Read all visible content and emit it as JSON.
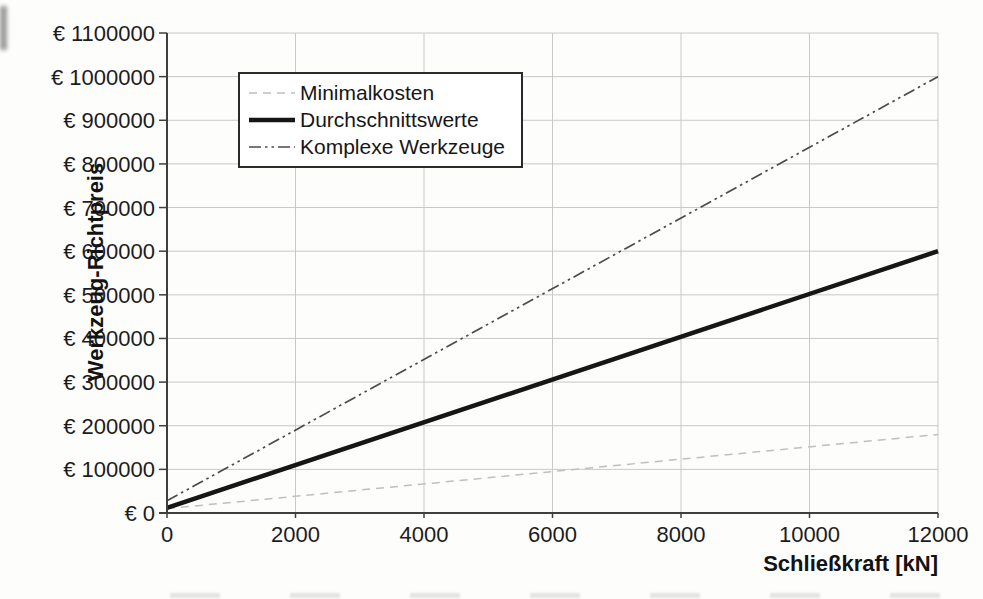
{
  "page": {
    "background": "#fcfcfc"
  },
  "chart_data": {
    "type": "line",
    "title": "",
    "xlabel": "Schließkraft [kN]",
    "ylabel": "Werkzeug-Richtpreis",
    "xlim": [
      0,
      12000
    ],
    "ylim": [
      0,
      1100000
    ],
    "x_ticks": [
      0,
      2000,
      4000,
      6000,
      8000,
      10000,
      12000
    ],
    "y_ticks": [
      0,
      100000,
      200000,
      300000,
      400000,
      500000,
      600000,
      700000,
      800000,
      900000,
      1000000,
      1100000
    ],
    "y_tick_prefix": "€ ",
    "grid": "on",
    "legend_position": "upper-left",
    "series": [
      {
        "name": "Minimalkosten",
        "x": [
          0,
          12000
        ],
        "y": [
          10000,
          180000
        ],
        "line_style": "dashed",
        "color": "#bfbfbf",
        "line_width": 1.5
      },
      {
        "name": "Durchschnittswerte",
        "x": [
          0,
          12000
        ],
        "y": [
          12000,
          600000
        ],
        "line_style": "solid",
        "color": "#161616",
        "line_width": 4.5
      },
      {
        "name": "Komplexe Werkzeuge",
        "x": [
          0,
          12000
        ],
        "y": [
          28000,
          1000000
        ],
        "line_style": "dash-dot-dot",
        "color": "#4b4b4b",
        "line_width": 1.7
      }
    ],
    "axis_color": "#3f3f3f",
    "grid_color": "#c9c9c9",
    "tick_label_color": "#1c1c1c"
  }
}
